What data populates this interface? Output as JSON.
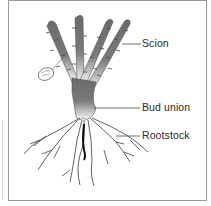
{
  "diagram": {
    "labels": {
      "scion": "Scion",
      "bud_union": "Bud union",
      "rootstock": "Rootstock"
    },
    "tag_text": "",
    "colors": {
      "stem": "#6e6e6e",
      "stem_light": "#d9d9d9",
      "roots": "#3a3a3a",
      "leader_line": "#4a4a4a",
      "border": "#9a9a9a"
    }
  }
}
